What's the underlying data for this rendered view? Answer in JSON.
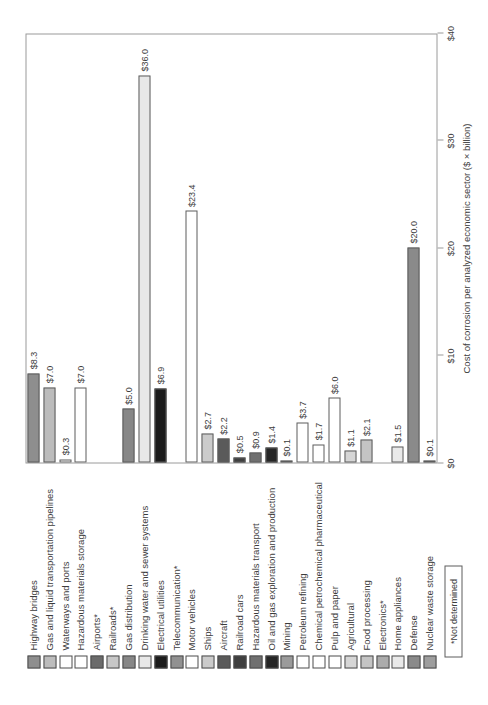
{
  "chart_data": {
    "type": "bar",
    "orientation": "horizontal-bars, whole figure rotated 90deg CCW in screenshot",
    "title": "",
    "xlabel": "Cost of corrosion per analyzed economic sector ($ × billion)",
    "ylabel": "",
    "xlim": [
      0,
      40
    ],
    "grid": false,
    "ticks": [
      "$0",
      "$10",
      "$20",
      "$30",
      "$40"
    ],
    "tick_values": [
      0,
      10,
      20,
      30,
      40
    ],
    "not_determined_note": "*Not determined",
    "categories": [
      "Highway bridges",
      "Gas and liquid transportation pipelines",
      "Waterways and ports",
      "Hazardous materials storage",
      "Airports*",
      "Railroads*",
      "Gas distribution",
      "Drinking water and sewer systems",
      "Electrical utilities",
      "Telecommunication*",
      "Motor vehicles",
      "Ships",
      "Aircraft",
      "Railroad cars",
      "Hazardous materials transport",
      "Oil and gas exploration and production",
      "Mining",
      "Petroleum refining",
      "Chemical petrochemical pharmaceutical",
      "Pulp and paper",
      "Agricultural",
      "Food processing",
      "Electronics*",
      "Home appliances",
      "Defense",
      "Nuclear waste storage"
    ],
    "values": [
      8.3,
      7.0,
      0.3,
      7.0,
      null,
      null,
      5.0,
      36.0,
      6.9,
      null,
      23.4,
      2.7,
      2.2,
      0.5,
      0.9,
      1.4,
      0.1,
      3.7,
      1.7,
      6.0,
      1.1,
      2.1,
      null,
      1.5,
      20.0,
      0.1
    ],
    "value_labels": [
      "$8.3",
      "$7.0",
      "$0.3",
      "$7.0",
      null,
      null,
      "$5.0",
      "$36.0",
      "$6.9",
      null,
      "$23.4",
      "$2.7",
      "$2.2",
      "$0.5",
      "$0.9",
      "$1.4",
      "$0.1",
      "$3.7",
      "$1.7",
      "$6.0",
      "$1.1",
      "$2.1",
      null,
      "$1.5",
      "$20.0",
      "$0.1"
    ],
    "colors": [
      "#8e8e8e",
      "#bcbcbc",
      "#ffffff",
      "#ffffff",
      "#6b6b6b",
      "#c7c7c7",
      "#878787",
      "#e8e8e8",
      "#1c1c1c",
      "#919191",
      "#ffffff",
      "#cbcbcb",
      "#5a5a5a",
      "#3f3f3f",
      "#707070",
      "#262626",
      "#9b9b9b",
      "#ffffff",
      "#ffffff",
      "#ffffff",
      "#d6d6d6",
      "#c4c4c4",
      "#ababab",
      "#e9e9e9",
      "#8a8a8a",
      "#9e9e9e"
    ]
  }
}
